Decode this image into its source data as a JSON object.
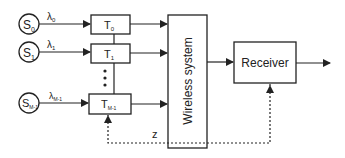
{
  "sources": [
    {
      "label": "S",
      "sub": "0",
      "rate": "λ",
      "rate_sub": "0"
    },
    {
      "label": "S",
      "sub": "1",
      "rate": "λ",
      "rate_sub": "1"
    },
    {
      "label": "S",
      "sub": "M-1",
      "rate": "λ",
      "rate_sub": "M-1"
    }
  ],
  "transmitters": [
    {
      "label": "T",
      "sub": "0"
    },
    {
      "label": "T",
      "sub": "1"
    },
    {
      "label": "T",
      "sub": "M-1"
    }
  ],
  "wireless": {
    "label": "Wireless system"
  },
  "receiver": {
    "label": "Receiver"
  },
  "feedback": {
    "label": "z"
  },
  "colors": {
    "stroke": "#222222",
    "background": "#ffffff"
  }
}
